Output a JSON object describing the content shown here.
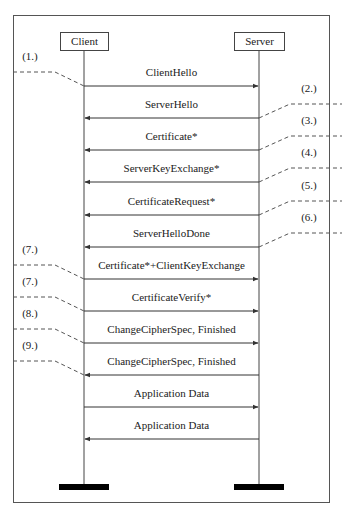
{
  "diagram": {
    "type": "sequence-diagram",
    "participants": [
      {
        "name": "Client",
        "x": 84
      },
      {
        "name": "Server",
        "x": 259
      }
    ],
    "messages": [
      {
        "label": "ClientHello",
        "from": "Client",
        "to": "Server",
        "y": 86,
        "step": "(1.)",
        "step_side": "left"
      },
      {
        "label": "ServerHello",
        "from": "Server",
        "to": "Client",
        "y": 118,
        "step": "(2.)",
        "step_side": "right"
      },
      {
        "label": "Certificate*",
        "from": "Server",
        "to": "Client",
        "y": 150,
        "step": "(3.)",
        "step_side": "right"
      },
      {
        "label": "ServerKeyExchange*",
        "from": "Server",
        "to": "Client",
        "y": 182,
        "step": "(4.)",
        "step_side": "right"
      },
      {
        "label": "CertificateRequest*",
        "from": "Server",
        "to": "Client",
        "y": 215,
        "step": "(5.)",
        "step_side": "right"
      },
      {
        "label": "ServerHelloDone",
        "from": "Server",
        "to": "Client",
        "y": 247,
        "step": "(6.)",
        "step_side": "right"
      },
      {
        "label": "Certificate*+ClientKeyExchange",
        "from": "Client",
        "to": "Server",
        "y": 279,
        "step": "(7.)",
        "step_side": "left"
      },
      {
        "label": "CertificateVerify*",
        "from": "Client",
        "to": "Server",
        "y": 311,
        "step": "(7.)",
        "step_side": "left"
      },
      {
        "label": "ChangeCipherSpec, Finished",
        "from": "Client",
        "to": "Server",
        "y": 343,
        "step": "(8.)",
        "step_side": "left"
      },
      {
        "label": "ChangeCipherSpec, Finished",
        "from": "Server",
        "to": "Client",
        "y": 375,
        "step": "(9.)",
        "step_side": "left"
      },
      {
        "label": "Application Data",
        "from": "Client",
        "to": "Server",
        "y": 407,
        "step": "",
        "step_side": ""
      },
      {
        "label": "Application Data",
        "from": "Server",
        "to": "Client",
        "y": 439,
        "step": "",
        "step_side": ""
      }
    ],
    "colors": {
      "line": "#333333",
      "text": "#222222",
      "bar": "#000000",
      "background": "#ffffff"
    }
  }
}
